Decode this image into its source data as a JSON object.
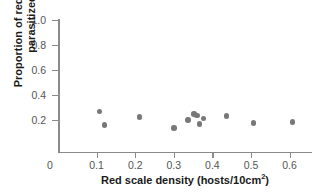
{
  "chart_data": {
    "type": "scatter",
    "title": "",
    "xlabel": "Red scale density (hosts/10cm2)",
    "xlabel_base": "Red scale density (hosts/10cm",
    "xlabel_sup": "2",
    "xlabel_tail": ")",
    "ylabel_line1": "Proportion of red scales",
    "ylabel_line2": "parasitized",
    "xlim": [
      0,
      0.655
    ],
    "ylim": [
      0,
      1.0
    ],
    "xticks": [
      0,
      0.1,
      0.2,
      0.3,
      0.4,
      0.5,
      0.6
    ],
    "xticklabels": [
      "0",
      "0.1",
      "0.2",
      "0.3",
      "0.4",
      "0.5",
      "0.6"
    ],
    "yticks": [
      0,
      0.2,
      0.4,
      0.6,
      0.8,
      1.0
    ],
    "yticklabels": [
      "0",
      "0.2",
      "0.4",
      "0.6",
      "0.8",
      "1.0"
    ],
    "grid": false,
    "legend": false,
    "marker_color": "#787878",
    "axis_color": "#8a8a8a",
    "tick_label_color": "#555555",
    "axis_title_color": "#1a1a1a",
    "points": [
      {
        "x": 0.108,
        "y": 0.268
      },
      {
        "x": 0.121,
        "y": 0.162
      },
      {
        "x": 0.211,
        "y": 0.226
      },
      {
        "x": 0.3,
        "y": 0.136
      },
      {
        "x": 0.337,
        "y": 0.2
      },
      {
        "x": 0.352,
        "y": 0.247
      },
      {
        "x": 0.36,
        "y": 0.238
      },
      {
        "x": 0.367,
        "y": 0.168
      },
      {
        "x": 0.377,
        "y": 0.214
      },
      {
        "x": 0.437,
        "y": 0.234
      },
      {
        "x": 0.506,
        "y": 0.175
      },
      {
        "x": 0.608,
        "y": 0.186
      }
    ]
  },
  "axes": {
    "origin_label": "0"
  }
}
